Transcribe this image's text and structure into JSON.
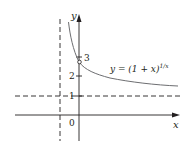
{
  "figure": {
    "axes": {
      "x_label": "x",
      "y_label": "y",
      "origin_label": "0"
    },
    "y_ticks": [
      {
        "value": 1,
        "label": "1"
      },
      {
        "value": 2,
        "label": "2"
      },
      {
        "value": 3,
        "label": "3"
      }
    ],
    "asymptotes": {
      "vertical": {
        "x": -1,
        "style": "dashed"
      },
      "horizontal": {
        "y": 1,
        "style": "dashed"
      }
    },
    "curve": {
      "equation_prefix": "y = (1 + x)",
      "equation_exponent": "1/x",
      "hole": {
        "x": 0,
        "y": 2.718,
        "style": "open circle"
      }
    },
    "colors": {
      "axes": "#231f20",
      "curve": "#6d6e71",
      "text": "#231f20"
    }
  }
}
